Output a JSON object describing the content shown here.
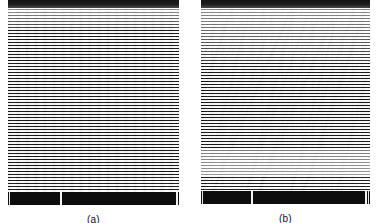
{
  "figure": {
    "background_color": "#ffffff",
    "panel_count": 2,
    "panels": [
      {
        "id": "a",
        "caption": "(a)",
        "description": "grayscale micrograph with regular vertical columnar structure and horizontal scan lines",
        "top_band_color": "#151515",
        "scalebar": {
          "color": "#0d0d0d",
          "tick_color": "#f2f2f2",
          "tick_positions_pct": [
            52,
            167,
            251
          ]
        }
      },
      {
        "id": "b",
        "caption": "(b)",
        "description": "grayscale micrograph with sheared wavy columnar structure and horizontal scan lines",
        "top_band_color": "#151515",
        "scalebar": {
          "color": "#0d0d0d",
          "tick_color": "#f2f2f2",
          "tick_positions_pct": [
            50,
            165,
            250
          ]
        }
      }
    ]
  },
  "chart_data": {
    "type": "heatmap",
    "title": "",
    "xlabel": "",
    "ylabel": "",
    "panels": [
      {
        "label": "(a)",
        "pattern": "straight vertical columns",
        "column_count": 19,
        "scanline_period_px": 3,
        "tone_profile": [
          "dark band top",
          "light upper",
          "mid-gray body",
          "dark bottom edge"
        ]
      },
      {
        "label": "(b)",
        "pattern": "curved / sheared columns",
        "column_count": 17,
        "scanline_period_px": 3,
        "tone_profile": [
          "dark band top",
          "light upper",
          "dark wavy mid-band",
          "light lower"
        ]
      }
    ]
  }
}
